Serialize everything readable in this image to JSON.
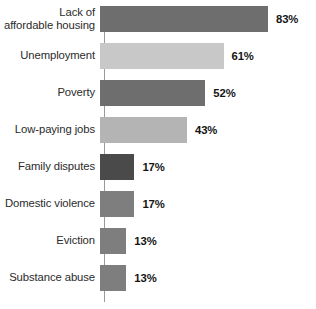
{
  "chart_data": {
    "type": "bar",
    "orientation": "horizontal",
    "title": "",
    "subtitle": "",
    "xlabel": "",
    "ylabel": "",
    "xlim": [
      0,
      100
    ],
    "grid": false,
    "legend": null,
    "value_suffix": "%",
    "categories": [
      "Lack of\naffordable housing",
      "Unemployment",
      "Poverty",
      "Low-paying jobs",
      "Family disputes",
      "Domestic violence",
      "Eviction",
      "Substance abuse"
    ],
    "values": [
      83,
      61,
      52,
      43,
      17,
      17,
      13,
      13
    ],
    "value_labels": [
      "83%",
      "61%",
      "52%",
      "43%",
      "17%",
      "17%",
      "13%",
      "13%"
    ],
    "bar_colors": [
      "#6e6e6e",
      "#c8c8c8",
      "#6e6e6e",
      "#b4b4b4",
      "#4a4a4a",
      "#7e7e7e",
      "#7e7e7e",
      "#7e7e7e"
    ]
  },
  "colors": {
    "background": "#ffffff",
    "axis_line": "#9a9a9a",
    "category_text": "#2b2b2b",
    "value_text": "#151515"
  }
}
